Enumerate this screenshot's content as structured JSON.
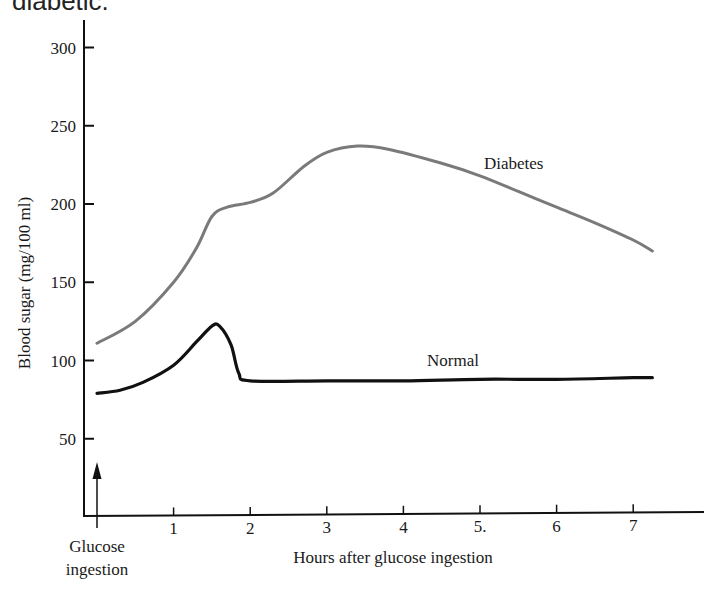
{
  "caption": "diabetic.",
  "chart_data": {
    "type": "line",
    "title": "",
    "xlabel": "Hours after glucose ingestion",
    "ylabel": "Blood sugar (mg/100 ml)",
    "xlim": [
      0,
      7.5
    ],
    "ylim": [
      0,
      310
    ],
    "x_ticks": [
      1,
      2,
      3,
      4,
      5,
      6,
      7
    ],
    "x_tick_labels": [
      "1",
      "2",
      "3",
      "4",
      "5.",
      "6",
      "7"
    ],
    "y_ticks": [
      50,
      100,
      150,
      200,
      250,
      300
    ],
    "y_tick_labels": [
      "50",
      "100",
      "150",
      "200",
      "250",
      "300"
    ],
    "grid": false,
    "annotations": [
      {
        "text": "Glucose ingestion",
        "x": 0,
        "type": "arrow-up",
        "lines": [
          "Glucose",
          "ingestion"
        ]
      }
    ],
    "series": [
      {
        "name": "Diabetes",
        "color": "#7a7a7a",
        "x": [
          0,
          0.5,
          1.0,
          1.3,
          1.5,
          1.7,
          2.0,
          2.3,
          2.7,
          3.0,
          3.4,
          3.8,
          4.5,
          5.0,
          5.5,
          6.0,
          6.5,
          7.0,
          7.25
        ],
        "y": [
          111,
          125,
          150,
          172,
          192,
          198,
          201,
          207,
          224,
          233,
          237,
          235,
          226,
          218,
          208,
          198,
          188,
          177,
          170
        ]
      },
      {
        "name": "Normal",
        "color": "#111111",
        "x": [
          0,
          0.3,
          0.6,
          1.0,
          1.3,
          1.5,
          1.6,
          1.75,
          1.85,
          2.0,
          3.0,
          4.0,
          5.0,
          6.0,
          7.0,
          7.25
        ],
        "y": [
          79,
          81,
          86,
          97,
          112,
          122,
          122,
          110,
          92,
          87,
          87,
          87,
          88,
          88,
          89,
          89
        ]
      }
    ],
    "legend": [
      {
        "label": "Diabetes",
        "position": "inline-above-curve"
      },
      {
        "label": "Normal",
        "position": "inline-above-curve"
      }
    ]
  }
}
